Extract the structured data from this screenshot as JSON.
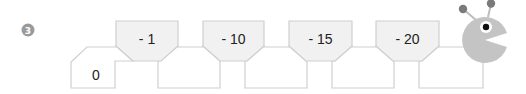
{
  "problem": {
    "number_badge": "3",
    "start_value": "0",
    "operations": [
      "- 1",
      "- 10",
      "- 15",
      "- 20"
    ],
    "answer_cells": [
      "",
      "",
      "",
      ""
    ]
  },
  "colors": {
    "box_stroke": "#cfcfcf",
    "top_box_fill": "#f1f1f1",
    "bottom_box_fill": "#ffffff",
    "head_fill": "#c4c4c4",
    "antenna_ball": "#7a7a7a",
    "badge_fill": "#9a9a9a"
  },
  "character": {
    "type": "caterpillar-pacman-head",
    "mouth_direction": "right"
  }
}
